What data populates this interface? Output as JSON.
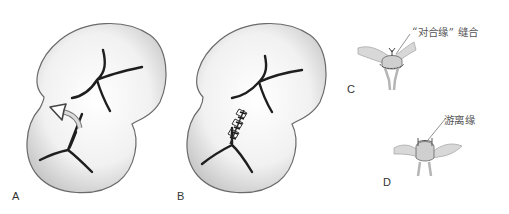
{
  "figure": {
    "panels": [
      {
        "id": "A",
        "label": "A",
        "description": "tissue with rotation arrow over central defect"
      },
      {
        "id": "B",
        "label": "B",
        "description": "tissue with central defect sutured closed"
      },
      {
        "id": "C",
        "label": "C",
        "annotation": "“对合缘” 缝合"
      },
      {
        "id": "D",
        "label": "D",
        "annotation": "游离缘"
      }
    ],
    "colors": {
      "outline": "#555555",
      "shade": "#cfcfcf",
      "fissure": "#1e1e1e",
      "label": "#333333",
      "annotation": "#555555"
    }
  }
}
